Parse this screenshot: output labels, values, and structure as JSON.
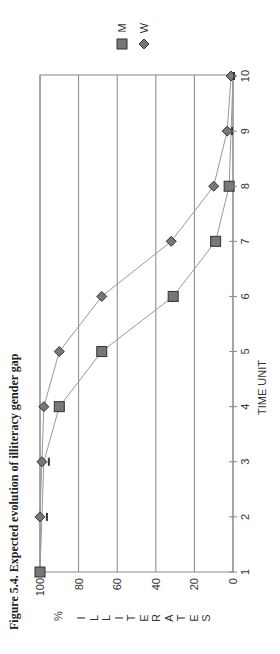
{
  "chart_data": {
    "type": "line",
    "title": "Figure 5.4. Expected evolution of illiteracy gender gap",
    "xlabel": "TIME UNIT",
    "ylabel": "% ILLITERATES",
    "x": [
      1,
      2,
      3,
      4,
      5,
      6,
      7,
      8,
      9,
      10
    ],
    "series": [
      {
        "name": "M",
        "marker": "square",
        "values": [
          100,
          99,
          98,
          90,
          68,
          31,
          9,
          2,
          1,
          0
        ]
      },
      {
        "name": "W",
        "marker": "diamond",
        "values": [
          100,
          100,
          99,
          98,
          90,
          68,
          32,
          10,
          3,
          1
        ]
      }
    ],
    "xlim": [
      1,
      10
    ],
    "ylim": [
      0,
      100
    ],
    "yticks": [
      0,
      20,
      40,
      60,
      80,
      100
    ],
    "xticks": [
      1,
      2,
      3,
      4,
      5,
      6,
      7,
      8,
      9,
      10
    ],
    "grid": true,
    "legend_position": "top-right",
    "orientation": "rotated-90"
  },
  "caption": "Figure 5.4. Expected evolution of illiteracy gender gap",
  "axis": {
    "x_label": "TIME UNIT",
    "y_label_percent": "%",
    "y_label_letters": [
      "I",
      "L",
      "L",
      "I",
      "T",
      "E",
      "R",
      "A",
      "T",
      "E",
      "S"
    ]
  },
  "legend": [
    {
      "label": "M",
      "marker": "square"
    },
    {
      "label": "W",
      "marker": "diamond"
    }
  ],
  "colors": {
    "line": "#999999",
    "marker_fill": "#777777",
    "marker_stroke": "#333333",
    "grid": "#888888",
    "text": "#333333"
  }
}
